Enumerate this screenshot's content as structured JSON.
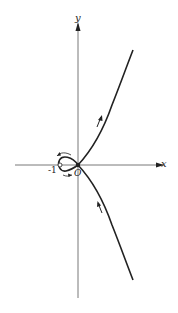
{
  "diagram": {
    "type": "curve-plot",
    "axes": {
      "x_label": "x",
      "y_label": "y",
      "origin_label": "O",
      "tick_labels": [
        "-1"
      ]
    },
    "curve": {
      "loop": {
        "from": "-1",
        "to": "O",
        "direction_arrows": [
          "top: leftward",
          "bottom: rightward"
        ]
      },
      "upper_branch": {
        "direction": "away from origin, up-right",
        "arrow": "up"
      },
      "lower_branch": {
        "direction": "toward origin, up-left",
        "arrow": "up"
      }
    },
    "colors": {
      "stroke": "#222222",
      "axis": "#555555",
      "background": "#ffffff"
    }
  }
}
